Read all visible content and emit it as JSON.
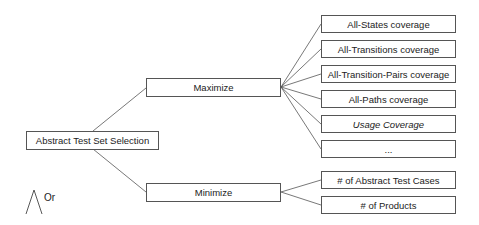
{
  "root": {
    "label": "Abstract Test Set Selection"
  },
  "branches": [
    {
      "label": "Maximize",
      "children": [
        {
          "label": "All-States coverage",
          "italic": false
        },
        {
          "label": "All-Transitions coverage",
          "italic": false
        },
        {
          "label": "All-Transition-Pairs coverage",
          "italic": false
        },
        {
          "label": "All-Paths coverage",
          "italic": false
        },
        {
          "label": "Usage Coverage",
          "italic": true
        },
        {
          "label": "...",
          "italic": false
        }
      ]
    },
    {
      "label": "Minimize",
      "children": [
        {
          "label": "# of Abstract Test Cases",
          "italic": false
        },
        {
          "label": "# of Products",
          "italic": false
        }
      ]
    }
  ],
  "legend": {
    "symbol": "or-gate-icon",
    "label": "Or"
  },
  "colors": {
    "line": "#555555",
    "border": "#555555",
    "background": "#ffffff"
  }
}
